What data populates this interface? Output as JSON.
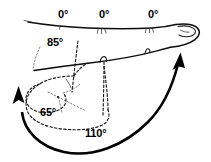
{
  "figure": {
    "background_color": "#ffffff",
    "ink_color": "#0d0d0d"
  },
  "labels": [
    {
      "id": "mcp-extension",
      "text": "0°",
      "joint": "metacarpophalangeal",
      "position": "proximal-dorsal",
      "x": 58,
      "y": 9
    },
    {
      "id": "pip-extension",
      "text": "0°",
      "joint": "proximal interphalangeal",
      "position": "middle-dorsal",
      "x": 99,
      "y": 9
    },
    {
      "id": "dip-extension",
      "text": "0°",
      "joint": "distal interphalangeal",
      "position": "distal-dorsal",
      "x": 148,
      "y": 9
    },
    {
      "id": "mcp-flexion",
      "text": "85°",
      "joint": "metacarpophalangeal",
      "position": "proximal-volar",
      "x": 47,
      "y": 37
    },
    {
      "id": "dip-flexion",
      "text": "65°",
      "joint": "distal interphalangeal",
      "position": "flexed-distal",
      "x": 40,
      "y": 107
    },
    {
      "id": "pip-flexion",
      "text": "110°",
      "joint": "proximal interphalangeal",
      "position": "flexed-middle",
      "x": 85,
      "y": 128
    }
  ],
  "arrows": [
    {
      "id": "flexion-sweep-arrow",
      "meaning": "direction of finger flexion sweeping from extended tip down and around to the left",
      "head_at": "upper-left"
    },
    {
      "id": "extension-sweep-arrow",
      "meaning": "direction of finger extension returning up to the extended fingertip",
      "head_at": "upper-right"
    }
  ],
  "outlines": [
    {
      "id": "extended-finger",
      "style": "solid",
      "meaning": "finger in full extension"
    },
    {
      "id": "flexed-finger",
      "style": "dashed",
      "meaning": "finger in full flexion"
    },
    {
      "id": "axis-guides",
      "style": "fine-dotted",
      "meaning": "joint axis reference lines used to measure the angles"
    }
  ]
}
